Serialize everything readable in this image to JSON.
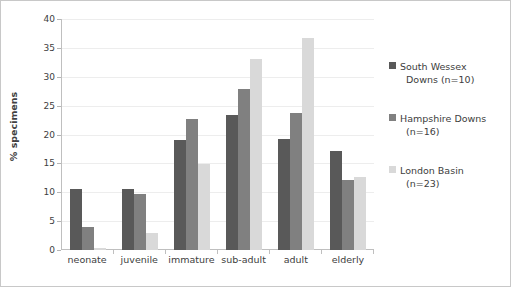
{
  "chart_data": {
    "type": "bar",
    "title": "",
    "xlabel": "",
    "ylabel": "% specimens",
    "ylim": [
      0,
      40
    ],
    "ytick_step": 5,
    "yticks": [
      "40",
      "35",
      "30",
      "25",
      "20",
      "15",
      "10",
      "5",
      "0"
    ],
    "grid": true,
    "legend_position": "right",
    "categories": [
      "neonate",
      "juvenile",
      "immature",
      "sub-adult",
      "adult",
      "elderly"
    ],
    "series": [
      {
        "name": "South Wessex Downs (n=10)",
        "legend_line1": "South Wessex",
        "legend_line2": "Downs (n=10)",
        "color": "#595959",
        "values": [
          10.6,
          10.6,
          19.0,
          23.4,
          19.2,
          17.1
        ]
      },
      {
        "name": "Hampshire Downs (n=16)",
        "legend_line1": "Hampshire Downs",
        "legend_line2": "(n=16)",
        "color": "#808080",
        "values": [
          4.0,
          9.7,
          22.7,
          27.9,
          23.8,
          12.2
        ]
      },
      {
        "name": "London Basin (n=23)",
        "legend_line1": "London Basin",
        "legend_line2": "(n=23)",
        "color": "#d9d9d9",
        "values": [
          0.4,
          2.9,
          14.9,
          33.0,
          36.7,
          12.7
        ]
      }
    ]
  }
}
